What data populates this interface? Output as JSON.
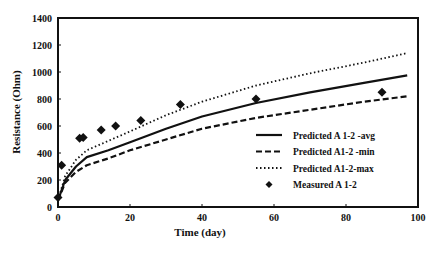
{
  "chart_data": {
    "type": "line",
    "title": "",
    "xlabel": "Time (day)",
    "ylabel": "Resistance (Ohm)",
    "xlim": [
      0,
      100
    ],
    "ylim": [
      0,
      1400
    ],
    "xticks": [
      0,
      20,
      40,
      60,
      80,
      100
    ],
    "yticks": [
      0,
      200,
      400,
      600,
      800,
      1000,
      1200,
      1400
    ],
    "grid": false,
    "legend_position": "lower right (inside plot)",
    "series": [
      {
        "name": "Predicted A 1-2 -avg",
        "style": "solid",
        "x": [
          0,
          2,
          5,
          8,
          14,
          20,
          30,
          40,
          55,
          70,
          85,
          97
        ],
        "y": [
          50,
          200,
          300,
          370,
          420,
          480,
          580,
          670,
          770,
          850,
          920,
          975
        ]
      },
      {
        "name": "Predicted A1-2 -min",
        "style": "dashed",
        "x": [
          0,
          2,
          5,
          8,
          14,
          20,
          30,
          40,
          55,
          70,
          85,
          97
        ],
        "y": [
          50,
          180,
          260,
          310,
          360,
          420,
          500,
          580,
          660,
          720,
          780,
          820
        ]
      },
      {
        "name": "Predicted A1-2-max",
        "style": "dotted",
        "x": [
          0,
          2,
          5,
          8,
          14,
          20,
          30,
          40,
          55,
          70,
          85,
          97
        ],
        "y": [
          50,
          230,
          350,
          420,
          490,
          560,
          680,
          780,
          900,
          990,
          1070,
          1140
        ]
      },
      {
        "name": "Measured A 1-2",
        "style": "markers (diamond)",
        "x": [
          0,
          1,
          6,
          7,
          12,
          16,
          23,
          34,
          55,
          90
        ],
        "y": [
          70,
          310,
          510,
          515,
          570,
          600,
          640,
          760,
          800,
          850
        ]
      }
    ]
  }
}
